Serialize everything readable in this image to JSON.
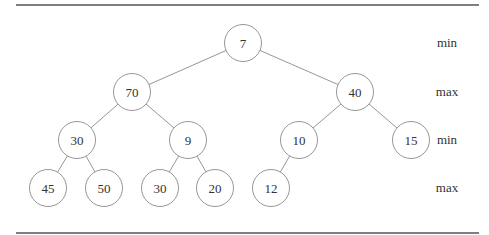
{
  "diagram": {
    "type": "min-max heap tree",
    "nodes": [
      {
        "id": "n0",
        "label": "7",
        "x": 243,
        "y": 43
      },
      {
        "id": "n1",
        "label": "70",
        "x": 132,
        "y": 92
      },
      {
        "id": "n2",
        "label": "40",
        "x": 355,
        "y": 92
      },
      {
        "id": "n3",
        "label": "30",
        "x": 77,
        "y": 140
      },
      {
        "id": "n4",
        "label": "9",
        "x": 188,
        "y": 140
      },
      {
        "id": "n5",
        "label": "10",
        "x": 299,
        "y": 140
      },
      {
        "id": "n6",
        "label": "15",
        "x": 411,
        "y": 140
      },
      {
        "id": "n7",
        "label": "45",
        "x": 48,
        "y": 188
      },
      {
        "id": "n8",
        "label": "50",
        "x": 104,
        "y": 188
      },
      {
        "id": "n9",
        "label": "30",
        "x": 160,
        "y": 188
      },
      {
        "id": "n10",
        "label": "20",
        "x": 215,
        "y": 188
      },
      {
        "id": "n11",
        "label": "12",
        "x": 271,
        "y": 188
      }
    ],
    "edges": [
      [
        "n0",
        "n1"
      ],
      [
        "n0",
        "n2"
      ],
      [
        "n1",
        "n3"
      ],
      [
        "n1",
        "n4"
      ],
      [
        "n2",
        "n5"
      ],
      [
        "n2",
        "n6"
      ],
      [
        "n3",
        "n7"
      ],
      [
        "n3",
        "n8"
      ],
      [
        "n4",
        "n9"
      ],
      [
        "n4",
        "n10"
      ],
      [
        "n5",
        "n11"
      ]
    ],
    "levels": [
      {
        "label": "min",
        "y": 43
      },
      {
        "label": "max",
        "y": 92
      },
      {
        "label": "min",
        "y": 140
      },
      {
        "label": "max",
        "y": 188
      }
    ],
    "node_radius": 18.5,
    "colors": {
      "stroke": "#8a8a8a",
      "text": "#333333",
      "rule": "#555555"
    }
  }
}
